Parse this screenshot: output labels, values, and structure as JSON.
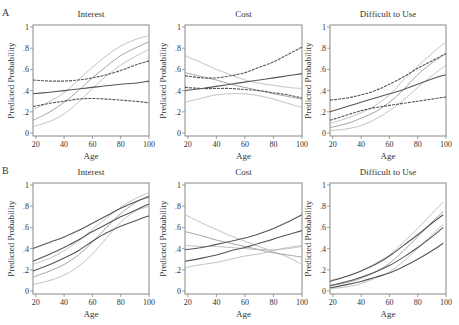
{
  "figure": {
    "row_labels": [
      "A",
      "B"
    ],
    "x_ticks": [
      20,
      40,
      60,
      80,
      100
    ],
    "x_tick_labels": [
      "20",
      "40",
      "60",
      "80",
      "100"
    ],
    "y_ticks": [
      0,
      0.2,
      0.4,
      0.6,
      0.8,
      1
    ],
    "y_tick_labels": [
      "0",
      ".2",
      ".4",
      ".6",
      ".8",
      "1"
    ],
    "xlabel": "Age",
    "ylabel": "Predicted Probability",
    "colors": {
      "dark": "#555555",
      "light": "#aaaaaa",
      "frame": "#888888"
    }
  },
  "chart_data": [
    {
      "type": "line",
      "row": "A",
      "title": "Interest",
      "xlabel": "Age",
      "ylabel": "Predicted Probability",
      "xlim": [
        18,
        100
      ],
      "ylim": [
        0,
        1
      ],
      "x": [
        18,
        30,
        40,
        50,
        60,
        70,
        80,
        90,
        100
      ],
      "series": [
        {
          "name": "dark-estimate",
          "style": "solid-dark",
          "values": [
            0.37,
            0.385,
            0.4,
            0.415,
            0.43,
            0.445,
            0.46,
            0.47,
            0.49
          ]
        },
        {
          "name": "dark-upper",
          "style": "dashed-dark",
          "values": [
            0.5,
            0.49,
            0.49,
            0.5,
            0.52,
            0.55,
            0.59,
            0.64,
            0.68
          ]
        },
        {
          "name": "dark-lower",
          "style": "dashed-dark",
          "values": [
            0.25,
            0.28,
            0.3,
            0.32,
            0.325,
            0.32,
            0.31,
            0.3,
            0.285
          ]
        },
        {
          "name": "light-estimate",
          "style": "solid-light",
          "values": [
            0.12,
            0.2,
            0.29,
            0.4,
            0.52,
            0.63,
            0.73,
            0.8,
            0.86
          ]
        },
        {
          "name": "light-upper",
          "style": "light",
          "values": [
            0.22,
            0.3,
            0.38,
            0.5,
            0.62,
            0.73,
            0.82,
            0.88,
            0.92
          ]
        },
        {
          "name": "light-lower",
          "style": "light",
          "values": [
            0.06,
            0.11,
            0.18,
            0.29,
            0.42,
            0.54,
            0.64,
            0.72,
            0.79
          ]
        }
      ]
    },
    {
      "type": "line",
      "row": "A",
      "title": "Cost",
      "xlabel": "Age",
      "ylabel": "Predicted Probability",
      "xlim": [
        18,
        100
      ],
      "ylim": [
        0,
        1
      ],
      "x": [
        18,
        30,
        40,
        50,
        60,
        70,
        80,
        90,
        100
      ],
      "series": [
        {
          "name": "dark-estimate",
          "style": "solid-dark",
          "values": [
            0.4,
            0.42,
            0.44,
            0.46,
            0.48,
            0.5,
            0.52,
            0.54,
            0.56
          ]
        },
        {
          "name": "dark-upper",
          "style": "dashed-dark",
          "values": [
            0.54,
            0.52,
            0.52,
            0.54,
            0.57,
            0.62,
            0.67,
            0.74,
            0.81
          ]
        },
        {
          "name": "dark-lower",
          "style": "dashed-dark",
          "values": [
            0.43,
            0.42,
            0.42,
            0.42,
            0.41,
            0.4,
            0.38,
            0.36,
            0.33
          ]
        },
        {
          "name": "light-estimate",
          "style": "solid-light",
          "values": [
            0.57,
            0.53,
            0.5,
            0.46,
            0.43,
            0.4,
            0.37,
            0.345,
            0.32
          ]
        },
        {
          "name": "light-upper",
          "style": "light",
          "values": [
            0.73,
            0.66,
            0.6,
            0.55,
            0.5,
            0.47,
            0.45,
            0.43,
            0.42
          ]
        },
        {
          "name": "light-lower",
          "style": "light",
          "values": [
            0.29,
            0.33,
            0.36,
            0.37,
            0.37,
            0.35,
            0.32,
            0.28,
            0.24
          ]
        }
      ]
    },
    {
      "type": "line",
      "row": "A",
      "title": "Difficult to Use",
      "xlabel": "Age",
      "ylabel": "Predicted Probability",
      "xlim": [
        18,
        100
      ],
      "ylim": [
        0,
        1
      ],
      "x": [
        18,
        30,
        40,
        50,
        60,
        70,
        80,
        90,
        100
      ],
      "series": [
        {
          "name": "dark-estimate",
          "style": "solid-dark",
          "values": [
            0.2,
            0.25,
            0.29,
            0.33,
            0.37,
            0.41,
            0.46,
            0.51,
            0.55
          ]
        },
        {
          "name": "dark-upper",
          "style": "dashed-dark",
          "values": [
            0.31,
            0.33,
            0.36,
            0.4,
            0.46,
            0.53,
            0.61,
            0.68,
            0.75
          ]
        },
        {
          "name": "dark-lower",
          "style": "dashed-dark",
          "values": [
            0.12,
            0.17,
            0.21,
            0.24,
            0.26,
            0.28,
            0.3,
            0.32,
            0.34
          ]
        },
        {
          "name": "light-estimate",
          "style": "solid-light",
          "values": [
            0.05,
            0.09,
            0.14,
            0.2,
            0.29,
            0.41,
            0.55,
            0.66,
            0.75
          ]
        },
        {
          "name": "light-upper",
          "style": "light",
          "values": [
            0.09,
            0.14,
            0.19,
            0.26,
            0.36,
            0.5,
            0.63,
            0.75,
            0.86
          ]
        },
        {
          "name": "light-lower",
          "style": "light",
          "values": [
            0.02,
            0.04,
            0.07,
            0.13,
            0.21,
            0.31,
            0.43,
            0.54,
            0.64
          ]
        }
      ]
    },
    {
      "type": "line",
      "row": "B",
      "title": "Interest",
      "xlabel": "Age",
      "ylabel": "Predicted Probability",
      "xlim": [
        18,
        100
      ],
      "ylim": [
        0,
        1
      ],
      "x": [
        18,
        30,
        40,
        50,
        60,
        70,
        80,
        90,
        100
      ],
      "series": [
        {
          "name": "dark-upper",
          "style": "solid-dark",
          "values": [
            0.4,
            0.46,
            0.51,
            0.57,
            0.64,
            0.71,
            0.78,
            0.84,
            0.89
          ]
        },
        {
          "name": "dark-estimate",
          "style": "solid-dark",
          "values": [
            0.28,
            0.35,
            0.41,
            0.48,
            0.56,
            0.63,
            0.7,
            0.76,
            0.82
          ]
        },
        {
          "name": "dark-lower",
          "style": "solid-dark",
          "values": [
            0.19,
            0.25,
            0.31,
            0.38,
            0.47,
            0.55,
            0.61,
            0.66,
            0.71
          ]
        },
        {
          "name": "light-upper",
          "style": "light",
          "values": [
            0.25,
            0.31,
            0.38,
            0.47,
            0.58,
            0.69,
            0.79,
            0.87,
            0.93
          ]
        },
        {
          "name": "light-estimate",
          "style": "solid-light",
          "values": [
            0.13,
            0.19,
            0.25,
            0.34,
            0.46,
            0.6,
            0.73,
            0.83,
            0.9
          ]
        },
        {
          "name": "light-lower",
          "style": "light",
          "values": [
            0.06,
            0.1,
            0.15,
            0.23,
            0.35,
            0.5,
            0.65,
            0.75,
            0.8
          ]
        }
      ]
    },
    {
      "type": "line",
      "row": "B",
      "title": "Cost",
      "xlabel": "Age",
      "ylabel": "Predicted Probability",
      "xlim": [
        18,
        100
      ],
      "ylim": [
        0,
        1
      ],
      "x": [
        18,
        30,
        40,
        50,
        60,
        70,
        80,
        90,
        100
      ],
      "series": [
        {
          "name": "dark-upper",
          "style": "solid-dark",
          "values": [
            0.39,
            0.41,
            0.44,
            0.47,
            0.5,
            0.54,
            0.59,
            0.65,
            0.72
          ]
        },
        {
          "name": "dark-estimate",
          "style": "solid-dark",
          "values": [
            0.28,
            0.31,
            0.34,
            0.38,
            0.41,
            0.45,
            0.49,
            0.53,
            0.57
          ]
        },
        {
          "name": "light-upper",
          "style": "light",
          "values": [
            0.72,
            0.64,
            0.58,
            0.52,
            0.47,
            0.42,
            0.37,
            0.32,
            0.25
          ]
        },
        {
          "name": "light-estimate",
          "style": "solid-light",
          "values": [
            0.56,
            0.52,
            0.48,
            0.45,
            0.42,
            0.39,
            0.36,
            0.34,
            0.32
          ]
        },
        {
          "name": "light-mid",
          "style": "light",
          "values": [
            0.43,
            0.42,
            0.42,
            0.41,
            0.4,
            0.39,
            0.39,
            0.4,
            0.42
          ]
        },
        {
          "name": "light-lower",
          "style": "light",
          "values": [
            0.22,
            0.25,
            0.27,
            0.3,
            0.33,
            0.35,
            0.38,
            0.41,
            0.43
          ]
        }
      ]
    },
    {
      "type": "line",
      "row": "B",
      "title": "Difficult to Use",
      "xlabel": "Age",
      "ylabel": "Predicted Probability",
      "xlim": [
        18,
        100
      ],
      "ylim": [
        0,
        1
      ],
      "x": [
        18,
        30,
        40,
        50,
        60,
        70,
        80,
        90,
        98
      ],
      "series": [
        {
          "name": "dark-upper",
          "style": "solid-dark",
          "values": [
            0.09,
            0.14,
            0.19,
            0.25,
            0.33,
            0.43,
            0.53,
            0.64,
            0.72
          ]
        },
        {
          "name": "dark-estimate",
          "style": "solid-dark",
          "values": [
            0.05,
            0.09,
            0.13,
            0.18,
            0.24,
            0.32,
            0.41,
            0.51,
            0.6
          ]
        },
        {
          "name": "dark-lower",
          "style": "solid-dark",
          "values": [
            0.03,
            0.06,
            0.09,
            0.13,
            0.17,
            0.23,
            0.3,
            0.38,
            0.45
          ]
        },
        {
          "name": "light-upper",
          "style": "light",
          "values": [
            0.1,
            0.14,
            0.19,
            0.26,
            0.34,
            0.46,
            0.59,
            0.73,
            0.84
          ]
        },
        {
          "name": "light-estimate",
          "style": "solid-light",
          "values": [
            0.05,
            0.08,
            0.12,
            0.18,
            0.26,
            0.38,
            0.51,
            0.65,
            0.75
          ]
        },
        {
          "name": "light-lower",
          "style": "light",
          "values": [
            0.02,
            0.04,
            0.07,
            0.12,
            0.18,
            0.28,
            0.4,
            0.53,
            0.63
          ]
        }
      ]
    }
  ]
}
